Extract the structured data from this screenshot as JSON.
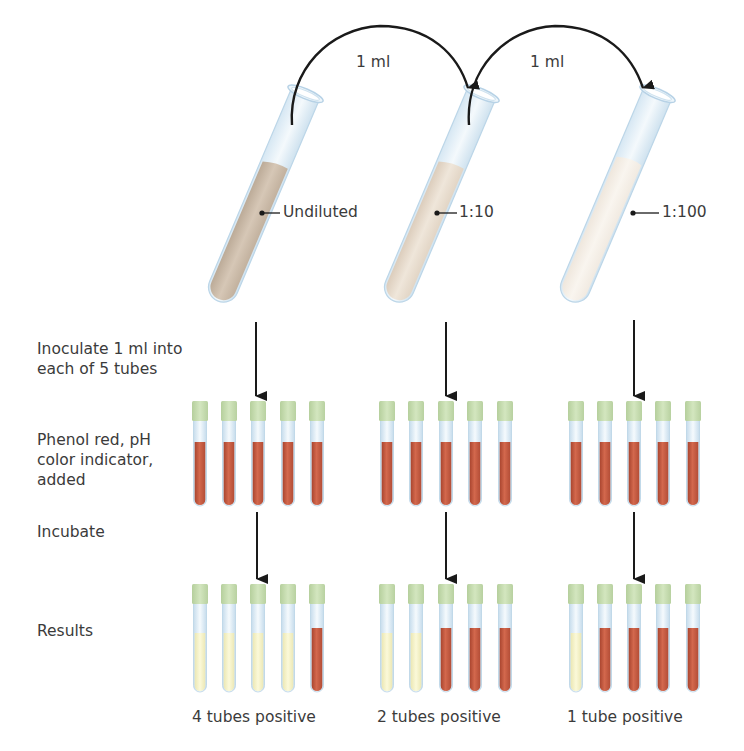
{
  "transfers": [
    {
      "label": "1 ml",
      "from": "undiluted",
      "to": "1:10"
    },
    {
      "label": "1 ml",
      "from": "1:10",
      "to": "1:100"
    }
  ],
  "dilution_tubes": [
    {
      "label": "Undiluted",
      "liquid_color": "#cdbcaa"
    },
    {
      "label": "1:10",
      "liquid_color": "#e6dacb"
    },
    {
      "label": "1:100",
      "liquid_color": "#f3ede4"
    }
  ],
  "steps": {
    "inoculate": "Inoculate 1 ml into each of 5 tubes",
    "inoculate_line1": "Inoculate 1 ml into",
    "inoculate_line2": "each of 5 tubes",
    "phenol_line1": "Phenol red, pH",
    "phenol_line2": "color indicator,",
    "phenol_line3": "added",
    "incubate": "Incubate",
    "results": "Results"
  },
  "groups": [
    {
      "dilution": "Undiluted",
      "results": [
        "yellow",
        "yellow",
        "yellow",
        "yellow",
        "red"
      ],
      "result_label": "4 tubes positive"
    },
    {
      "dilution": "1:10",
      "results": [
        "yellow",
        "yellow",
        "red",
        "red",
        "red"
      ],
      "result_label": "2 tubes positive"
    },
    {
      "dilution": "1:100",
      "results": [
        "yellow",
        "red",
        "red",
        "red",
        "red"
      ],
      "result_label": "1 tube positive"
    }
  ],
  "colors": {
    "cap": "#c6dcae",
    "red": "#c65a42",
    "yellow": "#f3f0c3",
    "glass": "#cfe3f0",
    "arrow": "#1a1a1a"
  }
}
